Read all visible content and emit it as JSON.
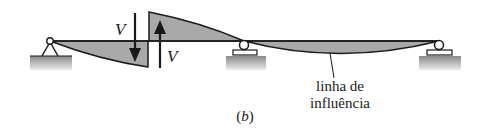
{
  "figure": {
    "label": "(b)",
    "caption_letter": "b"
  },
  "labels": {
    "shear_down": "V",
    "shear_up": "V",
    "influence_line_line1": "linha de",
    "influence_line_line2": "influência"
  },
  "supports": [
    {
      "type": "pin",
      "x": 50
    },
    {
      "type": "roller",
      "x": 244
    },
    {
      "type": "roller",
      "x": 439
    }
  ],
  "colors": {
    "fill_gray": "#a9a9a9",
    "line": "#1a1a1a",
    "ground_top": "#8c8c8c",
    "ground_bottom": "#e6e6e6"
  }
}
